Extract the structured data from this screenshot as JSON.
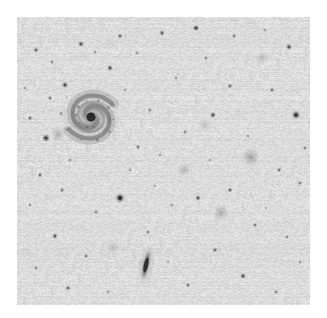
{
  "image": {
    "kind": "astronomical-field-image",
    "rendering": "inverted-grayscale",
    "frame": {
      "x": 17,
      "y": 17,
      "width": 293,
      "height": 288
    },
    "canvas": {
      "width": 327,
      "height": 318
    },
    "background_color": "#dcdcdc",
    "margin_color": "#ffffff",
    "noise_amplitude": 0.1,
    "alt_text": "Inverted grayscale astronomical field showing a face-on spiral galaxy at upper left, an edge-on galaxy at lower centre, numerous faint point-like stars and several small fuzzy galaxies on a noisy grey sky background."
  },
  "objects": {
    "spiral_galaxy": {
      "label": "face-on spiral galaxy",
      "cx": 91,
      "cy": 117,
      "radius": 31,
      "nucleus_radius": 4.5,
      "nucleus_color": "#2a2a2a",
      "disk_color": "#9a9a9a",
      "arm_color": "#7c7c7c",
      "rotation_deg": 18,
      "arm_count": 2
    },
    "edge_on_galaxy": {
      "label": "edge-on spiral galaxy",
      "cx": 146,
      "cy": 265,
      "length": 34,
      "width": 7,
      "tilt_deg": 12,
      "core_color": "#2f2f2f",
      "halo_color": "#aaaaaa"
    },
    "fuzzy_galaxies": [
      {
        "cx": 251,
        "cy": 157,
        "r": 5.0,
        "color": "#8e8e8e",
        "label": "fuzzy-galaxy-a"
      },
      {
        "cx": 221,
        "cy": 213,
        "r": 4.5,
        "color": "#9b9b9b",
        "label": "fuzzy-galaxy-b"
      },
      {
        "cx": 184,
        "cy": 170,
        "r": 4.0,
        "color": "#a6a6a6",
        "label": "fuzzy-galaxy-c"
      },
      {
        "cx": 58,
        "cy": 134,
        "r": 4.2,
        "color": "#a0a0a0",
        "label": "fuzzy-galaxy-d"
      },
      {
        "cx": 262,
        "cy": 58,
        "r": 3.6,
        "color": "#ababab",
        "label": "fuzzy-galaxy-e"
      },
      {
        "cx": 113,
        "cy": 247,
        "r": 3.4,
        "color": "#adadad",
        "label": "fuzzy-galaxy-f"
      },
      {
        "cx": 205,
        "cy": 125,
        "r": 3.2,
        "color": "#b0b0b0",
        "label": "fuzzy-galaxy-g"
      }
    ],
    "stars": [
      {
        "cx": 36,
        "cy": 50,
        "r": 1.4,
        "color": "#6f6f6f"
      },
      {
        "cx": 52,
        "cy": 62,
        "r": 1.1,
        "color": "#8a8a8a"
      },
      {
        "cx": 81,
        "cy": 44,
        "r": 1.5,
        "color": "#5c5c5c"
      },
      {
        "cx": 95,
        "cy": 52,
        "r": 1.0,
        "color": "#909090"
      },
      {
        "cx": 65,
        "cy": 85,
        "r": 1.6,
        "color": "#4f4f4f"
      },
      {
        "cx": 50,
        "cy": 98,
        "r": 1.2,
        "color": "#7d7d7d"
      },
      {
        "cx": 30,
        "cy": 118,
        "r": 1.3,
        "color": "#777777"
      },
      {
        "cx": 46,
        "cy": 138,
        "r": 1.9,
        "color": "#3e3e3e"
      },
      {
        "cx": 120,
        "cy": 36,
        "r": 1.3,
        "color": "#6e6e6e"
      },
      {
        "cx": 137,
        "cy": 53,
        "r": 1.0,
        "color": "#8e8e8e"
      },
      {
        "cx": 110,
        "cy": 68,
        "r": 1.5,
        "color": "#585858"
      },
      {
        "cx": 125,
        "cy": 90,
        "r": 0.9,
        "color": "#9a9a9a"
      },
      {
        "cx": 150,
        "cy": 110,
        "r": 1.1,
        "color": "#848484"
      },
      {
        "cx": 138,
        "cy": 147,
        "r": 1.2,
        "color": "#7a7a7a"
      },
      {
        "cx": 162,
        "cy": 33,
        "r": 1.4,
        "color": "#636363"
      },
      {
        "cx": 196,
        "cy": 28,
        "r": 1.6,
        "color": "#4a4a4a"
      },
      {
        "cx": 234,
        "cy": 36,
        "r": 1.2,
        "color": "#7b7b7b"
      },
      {
        "cx": 265,
        "cy": 30,
        "r": 1.0,
        "color": "#939393"
      },
      {
        "cx": 289,
        "cy": 47,
        "r": 1.5,
        "color": "#555555"
      },
      {
        "cx": 206,
        "cy": 58,
        "r": 1.1,
        "color": "#888888"
      },
      {
        "cx": 176,
        "cy": 78,
        "r": 1.0,
        "color": "#8e8e8e"
      },
      {
        "cx": 230,
        "cy": 86,
        "r": 1.3,
        "color": "#6c6c6c"
      },
      {
        "cx": 272,
        "cy": 90,
        "r": 1.2,
        "color": "#757575"
      },
      {
        "cx": 296,
        "cy": 115,
        "r": 2.1,
        "color": "#383838"
      },
      {
        "cx": 213,
        "cy": 115,
        "r": 1.5,
        "color": "#565656"
      },
      {
        "cx": 185,
        "cy": 132,
        "r": 1.1,
        "color": "#858585"
      },
      {
        "cx": 160,
        "cy": 155,
        "r": 1.0,
        "color": "#8f8f8f"
      },
      {
        "cx": 230,
        "cy": 190,
        "r": 1.3,
        "color": "#6a6a6a"
      },
      {
        "cx": 279,
        "cy": 170,
        "r": 1.2,
        "color": "#757575"
      },
      {
        "cx": 300,
        "cy": 183,
        "r": 1.1,
        "color": "#848484"
      },
      {
        "cx": 198,
        "cy": 198,
        "r": 1.4,
        "color": "#5e5e5e"
      },
      {
        "cx": 172,
        "cy": 205,
        "r": 1.0,
        "color": "#909090"
      },
      {
        "cx": 255,
        "cy": 225,
        "r": 1.2,
        "color": "#7c7c7c"
      },
      {
        "cx": 287,
        "cy": 237,
        "r": 1.1,
        "color": "#858585"
      },
      {
        "cx": 215,
        "cy": 250,
        "r": 1.3,
        "color": "#6d6d6d"
      },
      {
        "cx": 243,
        "cy": 276,
        "r": 1.5,
        "color": "#565656"
      },
      {
        "cx": 188,
        "cy": 285,
        "r": 1.2,
        "color": "#7a7a7a"
      },
      {
        "cx": 276,
        "cy": 292,
        "r": 1.1,
        "color": "#868686"
      },
      {
        "cx": 300,
        "cy": 262,
        "r": 1.0,
        "color": "#8d8d8d"
      },
      {
        "cx": 120,
        "cy": 198,
        "r": 2.3,
        "color": "#303030"
      },
      {
        "cx": 96,
        "cy": 212,
        "r": 1.1,
        "color": "#868686"
      },
      {
        "cx": 62,
        "cy": 190,
        "r": 1.2,
        "color": "#7e7e7e"
      },
      {
        "cx": 40,
        "cy": 175,
        "r": 1.3,
        "color": "#707070"
      },
      {
        "cx": 30,
        "cy": 205,
        "r": 1.0,
        "color": "#909090"
      },
      {
        "cx": 55,
        "cy": 236,
        "r": 1.4,
        "color": "#5f5f5f"
      },
      {
        "cx": 86,
        "cy": 256,
        "r": 1.2,
        "color": "#7b7b7b"
      },
      {
        "cx": 36,
        "cy": 268,
        "r": 1.1,
        "color": "#888888"
      },
      {
        "cx": 68,
        "cy": 288,
        "r": 1.3,
        "color": "#6f6f6f"
      },
      {
        "cx": 108,
        "cy": 292,
        "r": 1.0,
        "color": "#919191"
      },
      {
        "cx": 148,
        "cy": 232,
        "r": 1.1,
        "color": "#878787"
      },
      {
        "cx": 130,
        "cy": 170,
        "r": 1.0,
        "color": "#8c8c8c"
      },
      {
        "cx": 168,
        "cy": 262,
        "r": 0.9,
        "color": "#979797"
      },
      {
        "cx": 248,
        "cy": 136,
        "r": 1.0,
        "color": "#8b8b8b"
      },
      {
        "cx": 305,
        "cy": 148,
        "r": 1.1,
        "color": "#838383"
      },
      {
        "cx": 70,
        "cy": 160,
        "r": 1.0,
        "color": "#8e8e8e"
      },
      {
        "cx": 25,
        "cy": 88,
        "r": 1.0,
        "color": "#8f8f8f"
      },
      {
        "cx": 266,
        "cy": 208,
        "r": 0.9,
        "color": "#969696"
      },
      {
        "cx": 210,
        "cy": 160,
        "r": 0.9,
        "color": "#989898"
      },
      {
        "cx": 155,
        "cy": 186,
        "r": 0.9,
        "color": "#979797"
      },
      {
        "cx": 105,
        "cy": 130,
        "r": 0.9,
        "color": "#999999"
      }
    ]
  }
}
